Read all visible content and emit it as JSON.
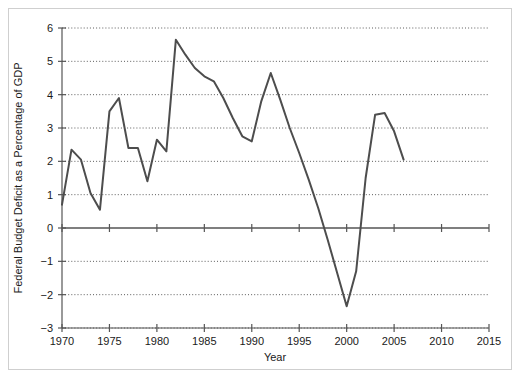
{
  "chart_data": {
    "type": "line",
    "title": "",
    "xlabel": "Year",
    "ylabel": "Federal Budget Deficit as a Percentage of GDP",
    "xlim": [
      1970,
      2015
    ],
    "ylim": [
      -3,
      6
    ],
    "xticks": [
      1970,
      1975,
      1980,
      1985,
      1990,
      1995,
      2000,
      2005,
      2010,
      2015
    ],
    "yticks": [
      -3,
      -2,
      -1,
      0,
      1,
      2,
      3,
      4,
      5,
      6
    ],
    "grid": "horizontal-dotted",
    "legend": "none",
    "line_color": "#4d4d4d",
    "series": [
      {
        "name": "Federal Budget Deficit as a Percentage of GDP",
        "x": [
          1970,
          1971,
          1972,
          1973,
          1974,
          1975,
          1976,
          1977,
          1978,
          1979,
          1980,
          1981,
          1982,
          1983,
          1984,
          1985,
          1986,
          1987,
          1988,
          1989,
          1990,
          1991,
          1992,
          1993,
          1994,
          1995,
          1996,
          1997,
          1998,
          1999,
          2000,
          2001,
          2002,
          2003,
          2004,
          2005,
          2006
        ],
        "values": [
          0.7,
          2.35,
          2.05,
          1.05,
          0.55,
          3.5,
          3.9,
          2.4,
          2.4,
          1.4,
          2.65,
          2.3,
          5.65,
          5.2,
          4.8,
          4.55,
          4.4,
          3.9,
          3.3,
          2.75,
          2.6,
          3.8,
          4.65,
          3.85,
          3.0,
          2.25,
          1.45,
          0.6,
          -0.35,
          -1.35,
          -2.35,
          -1.3,
          1.5,
          3.4,
          3.45,
          2.9,
          2.05
        ]
      }
    ]
  },
  "axis_labels": {
    "x_title": "Year",
    "y_title": "Federal Budget Deficit as a Percentage of GDP",
    "y_tick_6": "6",
    "y_tick_5": "5",
    "y_tick_4": "4",
    "y_tick_3": "3",
    "y_tick_2": "2",
    "y_tick_1": "1",
    "y_tick_0": "0",
    "y_tick_m1": "−1",
    "y_tick_m2": "−2",
    "y_tick_m3": "−3",
    "x_tick_1970": "1970",
    "x_tick_1975": "1975",
    "x_tick_1980": "1980",
    "x_tick_1985": "1985",
    "x_tick_1990": "1990",
    "x_tick_1995": "1995",
    "x_tick_2000": "2000",
    "x_tick_2005": "2005",
    "x_tick_2010": "2010",
    "x_tick_2015": "2015"
  }
}
